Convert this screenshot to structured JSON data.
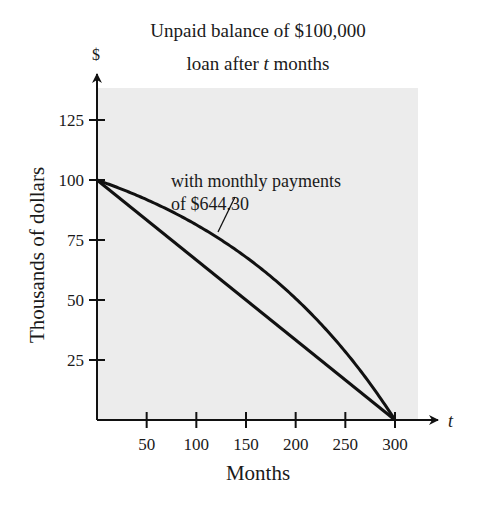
{
  "chart_data": {
    "type": "line",
    "title": [
      "Unpaid balance of $100,000",
      "loan after ",
      "t",
      " months"
    ],
    "title_line1": "Unpaid balance of $100,000",
    "title_line2_prefix": "loan after ",
    "title_line2_var": "t",
    "title_line2_suffix": " months",
    "xlabel": "Months",
    "ylabel": "Thousands of dollars",
    "x_axis_var": "t",
    "y_axis_unit": "$",
    "xlim": [
      0,
      330
    ],
    "ylim": [
      0,
      138
    ],
    "x_ticks": [
      50,
      100,
      150,
      200,
      250,
      300
    ],
    "y_ticks": [
      25,
      50,
      75,
      100,
      125
    ],
    "grid": false,
    "background": "#ececec",
    "annotation": {
      "line1": "with monthly payments",
      "line2": "of $644.30",
      "points_to_series": "Amortized balance"
    },
    "series": [
      {
        "name": "Amortized balance",
        "x": [
          0,
          25,
          50,
          75,
          100,
          125,
          150,
          175,
          200,
          225,
          250,
          275,
          300
        ],
        "values": [
          100,
          96.21,
          91.83,
          86.89,
          81.34,
          75.02,
          67.87,
          59.77,
          50.6,
          40.22,
          28.44,
          15.13,
          0
        ]
      },
      {
        "name": "Straight line",
        "x": [
          0,
          300
        ],
        "values": [
          100,
          0
        ]
      }
    ]
  }
}
